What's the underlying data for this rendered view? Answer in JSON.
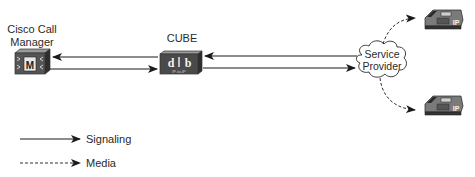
{
  "nodes": {
    "call_manager": {
      "label_line1": "Cisco Call",
      "label_line2": "Manager",
      "icon": "call-manager-icon",
      "icon_glyph": "M"
    },
    "cube": {
      "label": "CUBE",
      "icon": "cube-router-icon",
      "icon_sublabel": "IP-to-IP"
    },
    "service_provider": {
      "label_line1": "Service",
      "label_line2": "Provider",
      "icon": "cloud-icon"
    },
    "phone_top": {
      "icon": "ip-phone-icon",
      "badge": "IP"
    },
    "phone_bottom": {
      "icon": "ip-phone-icon",
      "badge": "IP"
    }
  },
  "connections": [
    {
      "from": "cube",
      "to": "call_manager",
      "type": "signaling"
    },
    {
      "from": "call_manager",
      "to": "cube",
      "type": "signaling"
    },
    {
      "from": "service_provider",
      "to": "cube",
      "type": "signaling"
    },
    {
      "from": "cube",
      "to": "service_provider",
      "type": "signaling"
    },
    {
      "from": "service_provider",
      "to": "phone_top",
      "type": "media"
    },
    {
      "from": "service_provider",
      "to": "phone_bottom",
      "type": "media"
    }
  ],
  "legend": {
    "signaling": "Signaling",
    "media": "Media"
  },
  "colors": {
    "line": "#1a1a1a",
    "device_dark": "#3d3d3d",
    "device_light": "#8a8a8a",
    "cloud_fill": "#ffffff"
  }
}
